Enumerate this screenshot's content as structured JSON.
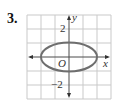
{
  "problem": {
    "number": "3."
  },
  "graph": {
    "x_label": "x",
    "y_label": "y",
    "origin_label": "O",
    "tick_labels": {
      "y_pos": "2",
      "y_neg": "−2"
    },
    "grid": {
      "cols": 6,
      "rows": 6,
      "unit_px": 14,
      "x_range": [
        -3,
        3
      ],
      "y_range": [
        -3,
        3
      ]
    },
    "curve": {
      "type": "ellipse",
      "equation": "x^2/4 + y^2 = 1",
      "center": [
        0,
        0
      ],
      "rx": 2,
      "ry": 1
    },
    "colors": {
      "grid": "#c9c9c9",
      "axis": "#4a4a4a",
      "curve": "#6e6e6e"
    }
  }
}
